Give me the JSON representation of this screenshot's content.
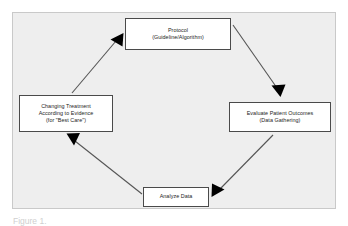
{
  "figure": {
    "background_color": "#eeeeee",
    "border_color": "#c9c9c9",
    "page_color": "#ffffff",
    "box_fill": "#ffffff",
    "box_border_color": "#4a4a4a",
    "arrow_color": "#555555",
    "arrowhead_color": "#000000",
    "caption": "Figure 1."
  },
  "diagram": {
    "type": "cycle",
    "direction": "clockwise",
    "nodes": [
      {
        "id": "protocol",
        "lines": [
          "Protocol",
          "(Guideline/Algorithm)"
        ]
      },
      {
        "id": "evaluate",
        "lines": [
          "Evaluate Patient Outcomes",
          "(Data Gathering)"
        ]
      },
      {
        "id": "analyze",
        "lines": [
          "Analyze Data"
        ]
      },
      {
        "id": "changing",
        "lines": [
          "Changing Treatment",
          "According to Evidence",
          "(for \"Best Care\")"
        ]
      }
    ],
    "edges": [
      {
        "id": "protocol-to-evaluate",
        "from": "protocol",
        "to": "evaluate"
      },
      {
        "id": "evaluate-to-analyze",
        "from": "evaluate",
        "to": "analyze"
      },
      {
        "id": "analyze-to-changing",
        "from": "analyze",
        "to": "changing"
      },
      {
        "id": "changing-to-protocol",
        "from": "changing",
        "to": "protocol"
      }
    ]
  }
}
